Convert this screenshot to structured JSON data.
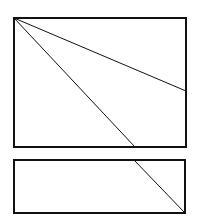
{
  "canvas": {
    "width": 199,
    "height": 223,
    "background": "#ffffff"
  },
  "stroke": {
    "color": "#111111",
    "rect_width": 2,
    "line_width": 1
  },
  "shapes": {
    "top_rect": {
      "x": 14,
      "y": 18,
      "width": 172,
      "height": 129
    },
    "bottom_rect": {
      "x": 14,
      "y": 160,
      "width": 171,
      "height": 53
    }
  },
  "lines": [
    {
      "name": "diagonal-to-right-edge",
      "x1": 14,
      "y1": 18,
      "x2": 186,
      "y2": 91
    },
    {
      "name": "diagonal-to-bottom-edge",
      "x1": 14,
      "y1": 18,
      "x2": 135,
      "y2": 147
    },
    {
      "name": "diagonal-lower-rect",
      "x1": 134,
      "y1": 160,
      "x2": 185,
      "y2": 213
    }
  ]
}
